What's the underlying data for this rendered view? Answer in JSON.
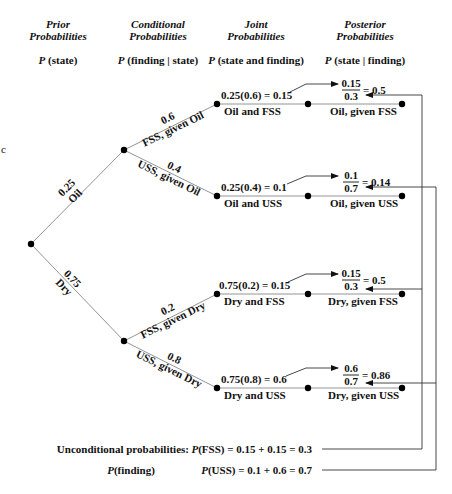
{
  "headers": {
    "prior": {
      "line1": "Prior",
      "line2": "Probabilities",
      "formula_p": "P",
      "formula_rest": " (state)"
    },
    "conditional": {
      "line1": "Conditional",
      "line2": "Probabilities",
      "formula_p": "P",
      "formula_rest": " (finding | state)"
    },
    "joint": {
      "line1": "Joint",
      "line2": "Probabilities",
      "formula_p": "P",
      "formula_rest": " (state and finding)"
    },
    "posterior": {
      "line1": "Posterior",
      "line2": "Probabilities",
      "formula_p": "P",
      "formula_rest": " (state | finding)"
    }
  },
  "stray_char": "c",
  "prior_branches": [
    {
      "prob": "0.25",
      "label": "Oil"
    },
    {
      "prob": "0.75",
      "label": "Dry"
    }
  ],
  "conditional_branches": [
    {
      "prob": "0.6",
      "label": "FSS, given Oil"
    },
    {
      "prob": "0.4",
      "label": "USS, given Oil"
    },
    {
      "prob": "0.2",
      "label": "FSS, given Dry"
    },
    {
      "prob": "0.8",
      "label": "USS, given Dry"
    }
  ],
  "joint": [
    {
      "formula": "0.25(0.6) = 0.15",
      "label": "Oil and FSS"
    },
    {
      "formula": "0.25(0.4) = 0.1",
      "label": "Oil and USS"
    },
    {
      "formula": "0.75(0.2) = 0.15",
      "label": "Dry and FSS"
    },
    {
      "formula": "0.75(0.8) = 0.6",
      "label": "Dry and USS"
    }
  ],
  "posterior": [
    {
      "numerator": "0.15",
      "denominator": "0.3",
      "result": "= 0.5",
      "label": "Oil, given FSS"
    },
    {
      "numerator": "0.1",
      "denominator": "0.7",
      "result": "= 0.14",
      "label": "Oil, given USS"
    },
    {
      "numerator": "0.15",
      "denominator": "0.3",
      "result": "= 0.5",
      "label": "Dry, given FSS"
    },
    {
      "numerator": "0.6",
      "denominator": "0.7",
      "result": "= 0.86",
      "label": "Dry, given USS"
    }
  ],
  "unconditional": {
    "title": "Unconditional probabilities:",
    "subtitle_p": "P",
    "subtitle_rest": "(finding)",
    "fss_p": "P",
    "fss_rest": "(FSS) = 0.15 + 0.15 = 0.3",
    "uss_p": "P",
    "uss_rest": "(USS) = 0.1 + 0.6 = 0.7"
  },
  "colors": {
    "branch_line": "#888888",
    "connector_line": "#333333",
    "node": "#000000"
  }
}
